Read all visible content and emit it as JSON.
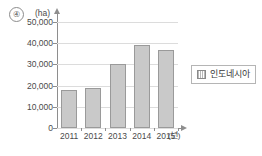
{
  "item_marker": "④",
  "legend": {
    "position": "right",
    "entries": [
      {
        "label": "인도네시아",
        "swatch": "hatched-gray-square"
      }
    ]
  },
  "axes": {
    "y_unit_label": "(ha)",
    "x_unit_label": "(년)"
  },
  "chart_data": {
    "type": "bar",
    "title": "",
    "subtitle": "",
    "xlabel": "(년)",
    "ylabel": "(ha)",
    "categories": [
      "2011",
      "2012",
      "2013",
      "2014",
      "2015"
    ],
    "series": [
      {
        "name": "인도네시아",
        "values": [
          18000,
          19000,
          30000,
          39000,
          37000
        ]
      }
    ],
    "ylim": [
      0,
      50000
    ],
    "ytick_labels": [
      "0",
      "10,000",
      "20,000",
      "30,000",
      "40,000",
      "50,000"
    ],
    "ytick_values": [
      0,
      10000,
      20000,
      30000,
      40000,
      50000
    ],
    "grid": true,
    "legend_position": "right",
    "colors": {
      "bar_fill": "#c9c9c9",
      "bar_border": "#9a9a9a",
      "gridline": "#dcdcdc",
      "axis": "#8e8e8e",
      "text": "#4a4a4a",
      "background": "#ffffff"
    }
  }
}
